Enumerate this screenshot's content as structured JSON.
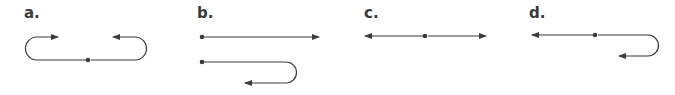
{
  "panels": [
    {
      "id": "a",
      "label": "a."
    },
    {
      "id": "b",
      "label": "b."
    },
    {
      "id": "c",
      "label": "c."
    },
    {
      "id": "d",
      "label": "d."
    }
  ],
  "colors": {
    "stroke": "#3a3a3a",
    "label": "#3a3a3a",
    "background": "#ffffff"
  }
}
